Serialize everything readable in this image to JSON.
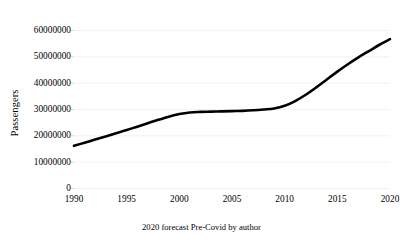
{
  "chart_data": {
    "type": "line",
    "title": "",
    "subtitle": "",
    "caption": "2020 forecast Pre-Covid by author",
    "xlabel": "",
    "ylabel": "Passengers",
    "xlim": [
      1990,
      2020
    ],
    "ylim": [
      0,
      60000000
    ],
    "grid": true,
    "grid_axis": "y",
    "legend": "none",
    "line_color": "#000000",
    "grid_color": "#f2f2f2",
    "x_tick_labels": [
      "1990",
      "1995",
      "2000",
      "2005",
      "2010",
      "2015",
      "2020"
    ],
    "x_ticks": [
      1990,
      1995,
      2000,
      2005,
      2010,
      2015,
      2020
    ],
    "y_tick_labels": [
      "0",
      "10000000",
      "20000000",
      "30000000",
      "40000000",
      "50000000",
      "60000000"
    ],
    "y_ticks": [
      0,
      10000000,
      20000000,
      30000000,
      40000000,
      50000000,
      60000000
    ],
    "x": [
      1990,
      1991,
      1992,
      1993,
      1994,
      1995,
      1996,
      1997,
      1998,
      1999,
      2000,
      2001,
      2002,
      2003,
      2004,
      2005,
      2006,
      2007,
      2008,
      2009,
      2010,
      2011,
      2012,
      2013,
      2014,
      2015,
      2016,
      2017,
      2018,
      2019,
      2020
    ],
    "series": [
      {
        "name": "Passengers",
        "values": [
          16000000,
          17200000,
          18400000,
          19600000,
          20800000,
          22000000,
          23300000,
          24600000,
          25900000,
          27100000,
          28100000,
          28700000,
          28900000,
          29000000,
          29100000,
          29200000,
          29300000,
          29500000,
          29800000,
          30200000,
          31200000,
          33000000,
          35400000,
          38200000,
          41200000,
          44200000,
          47000000,
          49600000,
          52000000,
          54400000,
          56500000
        ]
      }
    ]
  }
}
